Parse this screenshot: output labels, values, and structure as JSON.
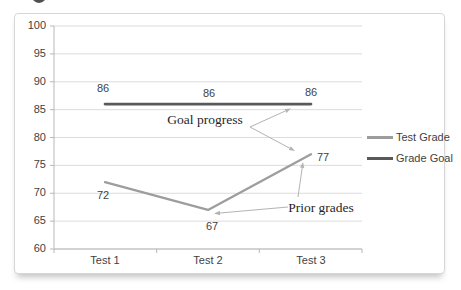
{
  "chart_data": {
    "type": "line",
    "title": "",
    "categories": [
      "Test 1",
      "Test 2",
      "Test 3"
    ],
    "series": [
      {
        "name": "Test Grade",
        "values": [
          72,
          67,
          77
        ],
        "color": "#9d9d9d"
      },
      {
        "name": "Grade Goal",
        "values": [
          86,
          86,
          86
        ],
        "color": "#595959"
      }
    ],
    "ylim": [
      60,
      100
    ],
    "yticks": [
      100,
      95,
      90,
      85,
      80,
      75,
      70,
      65,
      60
    ],
    "grid": "horizontal",
    "legend_position": "right",
    "annotations": [
      {
        "text": "Goal progress"
      },
      {
        "text": "Prior grades"
      }
    ]
  },
  "colors": {
    "gridline": "#dcdcdc",
    "axis": "#b8b8b8",
    "tick_text": "#3f3f3f",
    "annotation_text": "#1f1f1f",
    "arrow": "#b3b3b3",
    "panel_border": "#d6d6d6",
    "corner_mark": "#4f4f4f"
  }
}
